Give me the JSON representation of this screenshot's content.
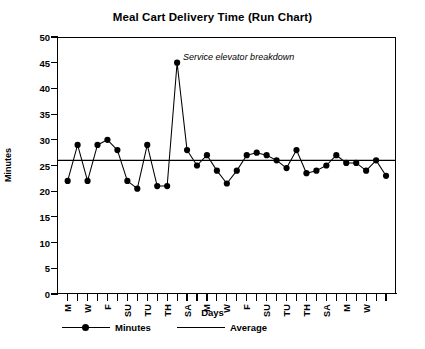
{
  "chart_data": {
    "type": "line",
    "title": "Meal Cart Delivery Time (Run Chart)",
    "xlabel": "Days",
    "ylabel": "Minutes",
    "ylim": [
      0,
      50
    ],
    "yticks": [
      0,
      5,
      10,
      15,
      20,
      25,
      30,
      35,
      40,
      45,
      50
    ],
    "grid": false,
    "legend_position": "bottom",
    "x_tick_count": 33,
    "categories": [
      "M",
      "TU",
      "W",
      "TH",
      "F",
      "SA",
      "SU",
      "M",
      "TU",
      "W",
      "TH",
      "F",
      "SA",
      "SU",
      "M",
      "TU",
      "W",
      "TH",
      "F",
      "SA",
      "SU",
      "M",
      "TU",
      "W",
      "TH",
      "F",
      "SA",
      "SU",
      "M",
      "TU",
      "W",
      "TH",
      "F"
    ],
    "x_tick_labels_visible": [
      "M",
      "",
      "W",
      "",
      "F",
      "",
      "SU",
      "",
      "TU",
      "",
      "TH",
      "",
      "SA",
      "",
      "M",
      "",
      "W",
      "",
      "F",
      "",
      "SU",
      "",
      "TU",
      "",
      "TH",
      "",
      "SA",
      "",
      "M",
      "",
      "W",
      "",
      ""
    ],
    "series": [
      {
        "name": "Minutes",
        "marker": "circle",
        "color": "#000000",
        "values": [
          22,
          29,
          22,
          29,
          30,
          28,
          22,
          20.5,
          29,
          21,
          21,
          45,
          28,
          25,
          27,
          24,
          21.5,
          24,
          27,
          27.5,
          27,
          26,
          24.5,
          28,
          23.5,
          24,
          25,
          27,
          25.5,
          25.5,
          24,
          26,
          23
        ]
      },
      {
        "name": "Average",
        "marker": "none",
        "color": "#000000",
        "constant_value": 26
      }
    ],
    "annotations": [
      {
        "text": "Service elevator breakdown",
        "points_to_index": 11,
        "style": "italic"
      }
    ]
  },
  "legend": {
    "items": [
      {
        "label": "Minutes",
        "type": "line-marker"
      },
      {
        "label": "Average",
        "type": "line"
      }
    ]
  }
}
